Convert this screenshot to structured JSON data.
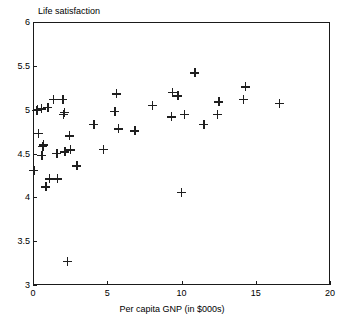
{
  "chart_data": {
    "type": "scatter",
    "title": "",
    "xlabel": "Per capita GNP (in $000s)",
    "ylabel": "Life satisfaction",
    "xlim": [
      0,
      20
    ],
    "ylim": [
      3,
      6
    ],
    "xticks": [
      "0",
      "5",
      "10",
      "15",
      "20"
    ],
    "xtick_values": [
      0,
      5,
      10,
      15,
      20
    ],
    "yticks": [
      "3",
      "3.5",
      "4",
      "4.5",
      "5",
      "5.5",
      "6"
    ],
    "ytick_values": [
      3,
      3.5,
      4,
      4.5,
      5,
      5.5,
      6
    ],
    "grid": false,
    "legend": null,
    "marker": "plus",
    "marker_color": "#1f1f1f",
    "frame": true,
    "points": [
      {
        "x": 0.05,
        "y": 4.31
      },
      {
        "x": 0.25,
        "y": 4.99
      },
      {
        "x": 0.3,
        "y": 5.0
      },
      {
        "x": 0.35,
        "y": 4.73
      },
      {
        "x": 0.55,
        "y": 5.01
      },
      {
        "x": 0.6,
        "y": 4.48
      },
      {
        "x": 0.65,
        "y": 4.58
      },
      {
        "x": 0.7,
        "y": 4.6
      },
      {
        "x": 0.85,
        "y": 4.12
      },
      {
        "x": 1.0,
        "y": 5.03
      },
      {
        "x": 1.1,
        "y": 4.21
      },
      {
        "x": 1.35,
        "y": 5.12
      },
      {
        "x": 1.6,
        "y": 4.5
      },
      {
        "x": 1.65,
        "y": 4.21
      },
      {
        "x": 2.0,
        "y": 5.12
      },
      {
        "x": 2.05,
        "y": 4.95
      },
      {
        "x": 2.1,
        "y": 4.97
      },
      {
        "x": 2.15,
        "y": 4.52
      },
      {
        "x": 2.3,
        "y": 3.27
      },
      {
        "x": 2.45,
        "y": 4.7
      },
      {
        "x": 2.5,
        "y": 4.54
      },
      {
        "x": 2.95,
        "y": 4.36
      },
      {
        "x": 4.1,
        "y": 4.83
      },
      {
        "x": 4.75,
        "y": 4.55
      },
      {
        "x": 5.5,
        "y": 4.98
      },
      {
        "x": 5.6,
        "y": 5.18
      },
      {
        "x": 5.75,
        "y": 4.78
      },
      {
        "x": 6.85,
        "y": 4.76
      },
      {
        "x": 8.05,
        "y": 5.05
      },
      {
        "x": 9.3,
        "y": 4.92
      },
      {
        "x": 9.4,
        "y": 5.2
      },
      {
        "x": 9.75,
        "y": 5.16
      },
      {
        "x": 10.0,
        "y": 4.06
      },
      {
        "x": 10.2,
        "y": 4.95
      },
      {
        "x": 10.9,
        "y": 5.42
      },
      {
        "x": 11.5,
        "y": 4.83
      },
      {
        "x": 12.4,
        "y": 4.95
      },
      {
        "x": 12.5,
        "y": 5.09
      },
      {
        "x": 14.15,
        "y": 5.12
      },
      {
        "x": 14.3,
        "y": 5.26
      },
      {
        "x": 16.6,
        "y": 5.07
      }
    ]
  },
  "layout": {
    "plot_left_px": 33,
    "plot_top_px": 22,
    "plot_width_px": 297,
    "plot_height_px": 263
  }
}
